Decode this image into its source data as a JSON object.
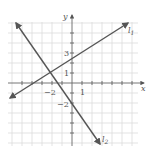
{
  "figure": {
    "type": "coordinate-plane-two-lines",
    "axes": {
      "x_label": "x",
      "y_label": "y",
      "x_tick_labels": [
        {
          "value": -2,
          "text": "−2"
        },
        {
          "value": 1,
          "text": "1"
        }
      ],
      "y_tick_labels": [
        {
          "value": 3,
          "text": "3"
        },
        {
          "value": 1,
          "text": "1"
        },
        {
          "value": -2,
          "text": "−2"
        }
      ],
      "x_range": [
        -6,
        6
      ],
      "y_range": [
        -6,
        6
      ],
      "grid": true
    },
    "lines": [
      {
        "name": "l1",
        "label_main": "l",
        "label_sub": "1",
        "slope": 0.75,
        "y_intercept": 2.5,
        "color": "#555555"
      },
      {
        "name": "l2",
        "label_main": "l",
        "label_sub": "2",
        "slope": -1.5,
        "y_intercept": -2,
        "color": "#555555"
      }
    ],
    "intersection": {
      "x": -2,
      "y": 1
    },
    "colors": {
      "grid": "#d9d9d9",
      "axis": "#666666",
      "line": "#555555",
      "text": "#555555"
    }
  }
}
